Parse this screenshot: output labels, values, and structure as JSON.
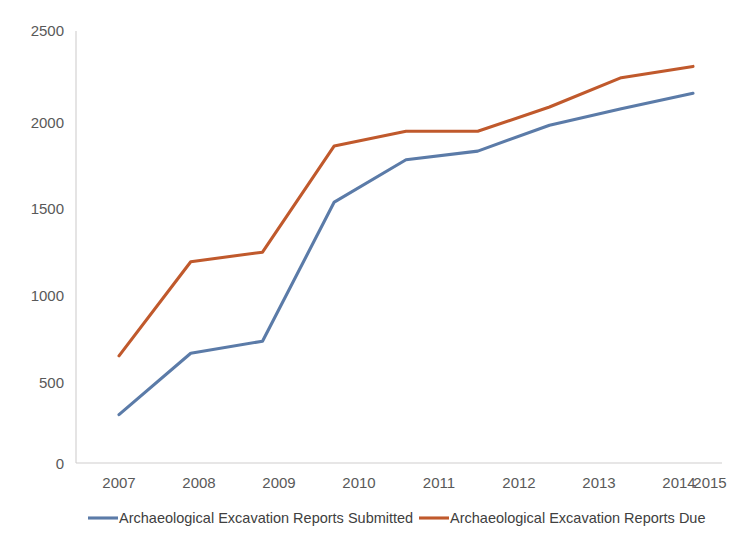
{
  "chart_data": {
    "type": "line",
    "title": "",
    "subtitle": "",
    "xlabel": "",
    "ylabel": "",
    "categories": [
      "2007",
      "2008",
      "2009",
      "2010",
      "2011",
      "2012",
      "2013",
      "2014",
      "2015"
    ],
    "x": [
      2007,
      2008,
      2009,
      2010,
      2011,
      2012,
      2013,
      2014,
      2015
    ],
    "series": [
      {
        "name": "Archaeological Excavation Reports Submitted",
        "color": "#5b7ba8",
        "values": [
          280,
          635,
          705,
          1510,
          1755,
          1805,
          1955,
          2050,
          2140
        ]
      },
      {
        "name": "Archaeological Excavation Reports Due",
        "color": "#c0592c",
        "values": [
          620,
          1165,
          1220,
          1835,
          1920,
          1920,
          2060,
          2230,
          2295
        ]
      }
    ],
    "ylim": [
      0,
      2500
    ],
    "yticks": [
      0,
      500,
      1000,
      1500,
      2000,
      2500
    ],
    "ytick_labels": [
      "0",
      "500",
      "1000",
      "1500",
      "2000",
      "2500"
    ],
    "xtick_labels": [
      "2007",
      "2008",
      "2009",
      "2010",
      "2011",
      "2012",
      "2013",
      "2014",
      "2015"
    ],
    "grid": false,
    "legend_position": "bottom",
    "axis_color": "#d0cece",
    "background": "#ffffff"
  },
  "legend": {
    "entries": [
      {
        "label": "Archaeological Excavation Reports Submitted",
        "color": "#5b7ba8"
      },
      {
        "label": "Archaeological Excavation Reports Due",
        "color": "#c0592c"
      }
    ]
  },
  "axes": {
    "y": {
      "labels": [
        "2500",
        "2000",
        "1500",
        "1000",
        "500",
        "0"
      ]
    },
    "x": {
      "labels": [
        "2007",
        "2008",
        "2009",
        "2010",
        "2011",
        "2012",
        "2013",
        "2014",
        "2015"
      ]
    }
  }
}
